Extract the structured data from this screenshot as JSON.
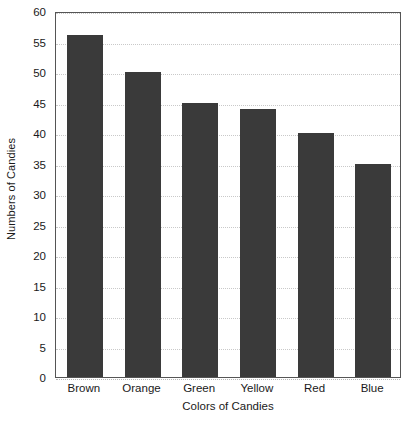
{
  "chart_data": {
    "type": "bar",
    "title": "",
    "subtitle": "",
    "categories": [
      "Brown",
      "Orange",
      "Green",
      "Yellow",
      "Red",
      "Blue"
    ],
    "values": [
      56,
      50,
      45,
      44,
      40,
      35
    ],
    "xlabel": "Colors of Candies",
    "ylabel": "Numbers of Candies",
    "ylim": [
      0,
      60
    ],
    "ytick_step": 5,
    "yticks": [
      0,
      5,
      10,
      15,
      20,
      25,
      30,
      35,
      40,
      45,
      50,
      55,
      60
    ],
    "ytick_labels": [
      "0",
      "5",
      "10",
      "15",
      "20",
      "25",
      "30",
      "35",
      "40",
      "45",
      "50",
      "55",
      "60"
    ],
    "grid": true,
    "grid_axis": "y",
    "grid_style": "dotted",
    "legend": false,
    "legend_position": "none",
    "bar_color": "#3a3a3a",
    "grid_color": "#c9c9c9",
    "frame_color": "#555555",
    "background_color": "#ffffff",
    "text_color": "#1a1a1a",
    "annotations": []
  }
}
